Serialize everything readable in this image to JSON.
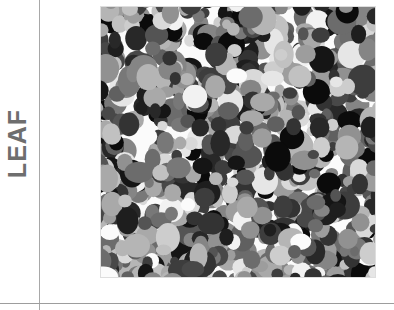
{
  "figure": {
    "width": 394,
    "height": 310,
    "background_color": "#ffffff"
  },
  "row_label": {
    "text": "LEAF",
    "orientation": "rotated-90-ccw",
    "color": "#6e6e6e"
  },
  "axes": {
    "vertical_rule_color": "#a8a8a8",
    "horizontal_rule_color": "#9d9d9d",
    "vertical_rule_x": 39,
    "horizontal_rule_y": 303
  },
  "panel": {
    "name": "leaf-texture-image",
    "left": 101,
    "top": 7,
    "width": 274,
    "height": 270,
    "background_color": "#fbfbfb",
    "border_color": "#a0a0a0"
  },
  "chart_data": {
    "type": "heatmap",
    "title": "",
    "subtitle": "",
    "xlabel": "",
    "ylabel": "LEAF",
    "row_labels": [
      "LEAF"
    ],
    "column_labels": [
      ""
    ],
    "colormap": "grayscale",
    "legend": [],
    "grid": false,
    "annotations": [],
    "value_range": [
      0,
      255
    ],
    "gray_levels": [
      "#0b0b0b",
      "#151515",
      "#1e1e1e",
      "#282828",
      "#333333",
      "#3d3d3d",
      "#484848",
      "#545454",
      "#606060",
      "#6c6c6c",
      "#787878",
      "#858585",
      "#919191",
      "#9d9d9d",
      "#a9a9a9",
      "#b5b5b5",
      "#c1c1c1",
      "#cdcdcd",
      "#d9d9d9",
      "#e6e6e6",
      "#f2f2f2",
      "#fbfbfb"
    ],
    "blob_count": 900,
    "blob_radius_range": [
      5,
      13
    ],
    "random_seed": 20240517
  }
}
